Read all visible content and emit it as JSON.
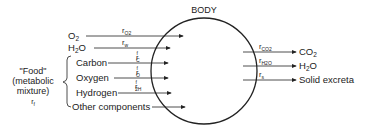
{
  "diagram": {
    "title": "BODY",
    "inputs": {
      "direct": [
        {
          "label": "O",
          "label_sub": "2",
          "rate": "r",
          "rate_sub": "O2",
          "rate_sup": ""
        },
        {
          "label": "H",
          "label_sub": "2",
          "label_tail": "O",
          "rate": "r",
          "rate_sub": "w",
          "rate_sup": ""
        }
      ],
      "food": {
        "group_label_line1": "\"Food\"",
        "group_label_line2": "(metabolic",
        "group_label_line3": "mixture)",
        "group_rate": "r",
        "group_rate_sub": "f",
        "components": [
          {
            "label": "Carbon",
            "rate": "r",
            "rate_sub": "C",
            "rate_sup": "f"
          },
          {
            "label": "Oxygen",
            "rate": "r",
            "rate_sub": "O",
            "rate_sup": "f"
          },
          {
            "label": "Hydrogen",
            "rate": "r",
            "rate_sub": "2H",
            "rate_sup": "f"
          },
          {
            "label": "Other components",
            "rate": "",
            "rate_sub": "",
            "rate_sup": ""
          }
        ]
      }
    },
    "outputs": [
      {
        "label": "CO",
        "label_sub": "2",
        "rate": "r",
        "rate_sub": "CO2"
      },
      {
        "label": "H",
        "label_sub": "2",
        "label_tail": "O",
        "rate": "r",
        "rate_sub": "H2O"
      },
      {
        "label": "Solid excreta",
        "rate": "r",
        "rate_sub": "s"
      }
    ],
    "colors": {
      "stroke": "#222222",
      "background": "#ffffff"
    }
  }
}
